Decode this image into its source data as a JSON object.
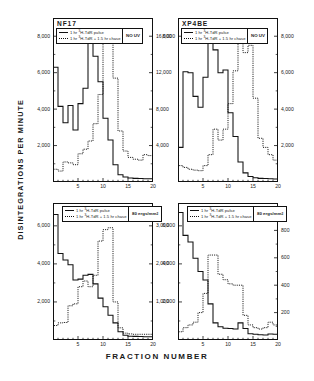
{
  "figure": {
    "ylabel": "DISINTEGRATIONS   PER   MINUTE",
    "xlabel": "FRACTION    NUMBER"
  },
  "legend_common": {
    "pulse_prefix": "1 hr ",
    "pulse_iso": "3H",
    "pulse_label": "1 hr  3H-TdR  pulse",
    "chase_label": "1 hr  3H-TdR + 1.5 hr chase",
    "pulse_text_a": "1 hr ",
    "pulse_text_b": "H-TdR  pulse",
    "chase_text_b": "H-TdR + 1.5 hr chase",
    "sup": "3"
  },
  "panels": [
    {
      "id": "top-left",
      "title": "NF17",
      "condition": "NO UV",
      "condition_sup": "",
      "left_ticks": [
        "8,000",
        "6,000",
        "4,000",
        "2,000"
      ],
      "left_values": [
        8000,
        6000,
        4000,
        2000
      ],
      "right_ticks": [
        "16,000",
        "12,000",
        "8,000",
        "4,000"
      ],
      "right_values": [
        16000,
        12000,
        8000,
        4000
      ],
      "x_ticks": [
        "5",
        "10",
        "15",
        "20"
      ],
      "x_values": [
        5,
        10,
        15,
        20
      ]
    },
    {
      "id": "top-right",
      "title": "XP4BE",
      "condition": "NO UV",
      "condition_sup": "",
      "left_ticks": [
        "8,000"
      ],
      "left_values": [
        8000
      ],
      "right_ticks": [
        "8,000",
        "6,000",
        "4,000",
        "2,000"
      ],
      "right_values": [
        8000,
        6000,
        4000,
        2000
      ],
      "x_ticks": [
        "5",
        "10",
        "15",
        "20"
      ],
      "x_values": [
        5,
        10,
        15,
        20
      ]
    },
    {
      "id": "bottom-left",
      "title": "",
      "condition": "80 ergs/mm",
      "condition_sup": "2",
      "left_ticks": [
        "6,000",
        "4,000",
        "2,000"
      ],
      "left_values": [
        6000,
        4000,
        2000
      ],
      "right_ticks": [
        "3,000",
        "2,000",
        "1,000"
      ],
      "right_values": [
        3000,
        2000,
        1000
      ],
      "x_ticks": [
        "5",
        "10",
        "15",
        "20"
      ],
      "x_values": [
        5,
        10,
        15,
        20
      ]
    },
    {
      "id": "bottom-right",
      "title": "",
      "condition": "80 ergs/mm",
      "condition_sup": "2",
      "left_ticks": [
        "6,000",
        "4,000",
        "2,000"
      ],
      "left_values": [
        6000,
        4000,
        2000
      ],
      "right_ticks": [
        "800",
        "600",
        "400",
        "200"
      ],
      "right_values": [
        800,
        600,
        400,
        200
      ],
      "x_ticks": [
        "5",
        "10",
        "15",
        "20"
      ],
      "x_values": [
        5,
        10,
        15,
        20
      ]
    }
  ],
  "chart_data": [
    {
      "type": "line",
      "panel": "top-left",
      "title": "NF17",
      "annotation": "NO UV",
      "xlabel": "Fraction number",
      "ylabel": "Disintegrations per minute",
      "xlim": [
        0,
        20
      ],
      "grid": false,
      "legend_position": "top-left-inside",
      "series": [
        {
          "name": "1 hr 3H-TdR pulse",
          "style": "solid",
          "axis": "left",
          "ylim": [
            0,
            9000
          ],
          "x": [
            1,
            2,
            3,
            4,
            5,
            6,
            7,
            8,
            9,
            10,
            11,
            12,
            13,
            14,
            15,
            16,
            17,
            18,
            19,
            20
          ],
          "values": [
            6300,
            4150,
            3250,
            4200,
            2850,
            4300,
            5150,
            8250,
            6900,
            5500,
            3500,
            2300,
            950,
            400,
            280,
            220,
            200,
            190,
            180,
            180
          ]
        },
        {
          "name": "1 hr 3H-TdR + 1.5 hr chase",
          "style": "dotted",
          "axis": "right",
          "ylim": [
            0,
            18000
          ],
          "x": [
            1,
            2,
            3,
            4,
            5,
            6,
            7,
            8,
            9,
            10,
            11,
            12,
            13,
            14,
            15,
            16,
            17,
            18,
            19,
            20
          ],
          "values": [
            1400,
            1200,
            2200,
            2100,
            1900,
            3100,
            3600,
            4500,
            6400,
            9600,
            16300,
            16000,
            11400,
            5600,
            3400,
            2700,
            2500,
            2400,
            3000,
            2900
          ]
        }
      ]
    },
    {
      "type": "line",
      "panel": "top-right",
      "title": "XP4BE",
      "annotation": "NO UV",
      "xlabel": "Fraction number",
      "ylabel": "Disintegrations per minute",
      "xlim": [
        0,
        20
      ],
      "grid": false,
      "legend_position": "top-left-inside",
      "series": [
        {
          "name": "1 hr 3H-TdR pulse",
          "style": "solid",
          "axis": "left",
          "ylim": [
            0,
            9000
          ],
          "x": [
            1,
            2,
            3,
            4,
            5,
            6,
            7,
            8,
            9,
            10,
            11,
            12,
            13,
            14,
            15,
            16,
            17,
            18,
            19,
            20
          ],
          "values": [
            1900,
            6050,
            6000,
            4700,
            4100,
            5750,
            7600,
            7250,
            6000,
            6150,
            3800,
            2500,
            1100,
            500,
            300,
            230,
            200,
            190,
            180,
            170
          ]
        },
        {
          "name": "1 hr 3H-TdR + 1.5 hr chase",
          "style": "dotted",
          "axis": "right",
          "ylim": [
            0,
            9000
          ],
          "x": [
            1,
            2,
            3,
            4,
            5,
            6,
            7,
            8,
            9,
            10,
            11,
            12,
            13,
            14,
            15,
            16,
            17,
            18,
            19,
            20
          ],
          "values": [
            900,
            800,
            700,
            650,
            620,
            900,
            1500,
            2900,
            2300,
            2900,
            4300,
            6100,
            7600,
            7100,
            7500,
            4600,
            2400,
            1900,
            1500,
            1200
          ]
        }
      ]
    },
    {
      "type": "line",
      "panel": "bottom-left",
      "title": "",
      "annotation": "80 ergs/mm2",
      "xlabel": "Fraction number",
      "ylabel": "Disintegrations per minute",
      "xlim": [
        0,
        20
      ],
      "grid": false,
      "legend_position": "top-left-inside",
      "series": [
        {
          "name": "1 hr 3H-TdR pulse",
          "style": "solid",
          "axis": "left",
          "ylim": [
            0,
            7200
          ],
          "x": [
            1,
            2,
            3,
            4,
            5,
            6,
            7,
            8,
            9,
            10,
            11,
            12,
            13,
            14,
            15,
            16,
            17,
            18,
            19,
            20
          ],
          "values": [
            6600,
            4550,
            4200,
            3950,
            3150,
            3200,
            3400,
            3450,
            2950,
            2200,
            1750,
            1300,
            900,
            430,
            250,
            200,
            190,
            180,
            170,
            170
          ]
        },
        {
          "name": "1 hr 3H-TdR + 1.5 hr chase",
          "style": "dotted",
          "axis": "right",
          "ylim": [
            0,
            3600
          ],
          "x": [
            1,
            2,
            3,
            4,
            5,
            6,
            7,
            8,
            9,
            10,
            11,
            12,
            13,
            14,
            15,
            16,
            17,
            18,
            19,
            20
          ],
          "values": [
            380,
            450,
            460,
            900,
            950,
            1400,
            1550,
            1400,
            1700,
            2600,
            2900,
            2950,
            1000,
            320,
            180,
            160,
            150,
            150,
            150,
            150
          ]
        }
      ]
    },
    {
      "type": "line",
      "panel": "bottom-right",
      "title": "",
      "annotation": "80 ergs/mm2",
      "xlabel": "Fraction number",
      "ylabel": "Disintegrations per minute",
      "xlim": [
        0,
        20
      ],
      "grid": false,
      "legend_position": "top-left-inside",
      "series": [
        {
          "name": "1 hr 3H-TdR pulse",
          "style": "solid",
          "axis": "left",
          "ylim": [
            0,
            7200
          ],
          "x": [
            1,
            2,
            3,
            4,
            5,
            6,
            7,
            8,
            9,
            10,
            11,
            12,
            13,
            14,
            15,
            16,
            17,
            18,
            19,
            20
          ],
          "values": [
            6700,
            5500,
            5150,
            4300,
            3600,
            3150,
            1900,
            900,
            700,
            620,
            600,
            580,
            900,
            600,
            330,
            300,
            280,
            260,
            320,
            300
          ]
        },
        {
          "name": "1 hr 3H-TdR + 1.5 hr chase",
          "style": "dotted",
          "axis": "right",
          "ylim": [
            0,
            1000
          ],
          "x": [
            1,
            2,
            3,
            4,
            5,
            6,
            7,
            8,
            9,
            10,
            11,
            12,
            13,
            14,
            15,
            16,
            17,
            18,
            19,
            20
          ],
          "values": [
            60,
            90,
            110,
            130,
            200,
            340,
            620,
            620,
            480,
            440,
            410,
            400,
            400,
            180,
            110,
            90,
            80,
            90,
            130,
            110
          ]
        }
      ]
    }
  ]
}
